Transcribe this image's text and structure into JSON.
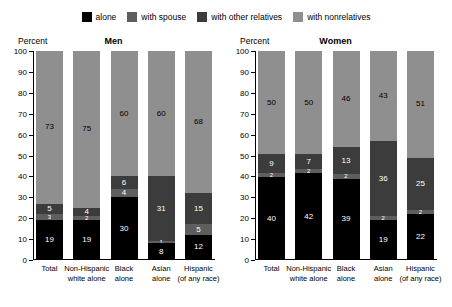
{
  "legend": {
    "items": [
      {
        "label": "alone",
        "color": "#000000",
        "key": "alone"
      },
      {
        "label": "with spouse",
        "color": "#5e5e5e",
        "key": "with_spouse"
      },
      {
        "label": "with other relatives",
        "color": "#3c3c3c",
        "key": "with_other_relatives"
      },
      {
        "label": "with nonrelatives",
        "color": "#8f8f8f",
        "key": "with_nonrelatives"
      }
    ]
  },
  "axis": {
    "label": "Percent",
    "ticks": [
      "100",
      "90",
      "80",
      "70",
      "60",
      "50",
      "40",
      "30",
      "20",
      "10",
      "0"
    ]
  },
  "panels": [
    {
      "title": "Men"
    },
    {
      "title": "Women"
    }
  ],
  "chart_data": [
    {
      "type": "bar",
      "title": "Men",
      "subtitle": "",
      "xlabel": "",
      "ylabel": "Percent",
      "ylim": [
        0,
        100
      ],
      "stacked": true,
      "grid": false,
      "legend_position": "top-center",
      "categories": [
        "Total",
        "Non-Hispanic white alone",
        "Black alone",
        "Asian alone",
        "Hispanic (of any race)"
      ],
      "category_lines": [
        [
          "Total"
        ],
        [
          "Non-Hispanic",
          "white alone"
        ],
        [
          "Black",
          "alone"
        ],
        [
          "Asian",
          "alone"
        ],
        [
          "Hispanic",
          "(of any race)"
        ]
      ],
      "series": [
        {
          "name": "with nonrelatives",
          "values": [
            73,
            75,
            60,
            60,
            68
          ]
        },
        {
          "name": "with other relatives",
          "values": [
            5,
            4,
            6,
            31,
            15
          ]
        },
        {
          "name": "with spouse",
          "values": [
            3,
            2,
            4,
            1,
            5
          ]
        },
        {
          "name": "alone",
          "values": [
            19,
            19,
            30,
            8,
            12
          ]
        }
      ]
    },
    {
      "type": "bar",
      "title": "Women",
      "subtitle": "",
      "xlabel": "",
      "ylabel": "Percent",
      "ylim": [
        0,
        100
      ],
      "stacked": true,
      "grid": false,
      "legend_position": "top-center",
      "categories": [
        "Total",
        "Non-Hispanic white alone",
        "Black alone",
        "Asian alone",
        "Hispanic (of any race)"
      ],
      "category_lines": [
        [
          "Total"
        ],
        [
          "Non-Hispanic",
          "white alone"
        ],
        [
          "Black",
          "alone"
        ],
        [
          "Asian",
          "alone"
        ],
        [
          "Hispanic",
          "(of any race)"
        ]
      ],
      "series": [
        {
          "name": "with nonrelatives",
          "values": [
            50,
            50,
            46,
            43,
            51
          ]
        },
        {
          "name": "with other relatives",
          "values": [
            9,
            7,
            13,
            36,
            25
          ]
        },
        {
          "name": "with spouse",
          "values": [
            2,
            2,
            2,
            2,
            2
          ]
        },
        {
          "name": "alone",
          "values": [
            40,
            42,
            39,
            19,
            22
          ]
        }
      ]
    }
  ]
}
